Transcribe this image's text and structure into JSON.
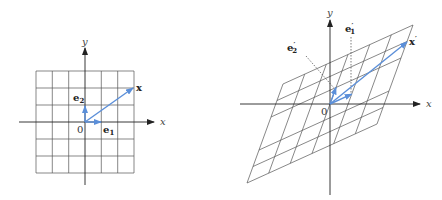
{
  "figure": {
    "left_panel": {
      "axis_labels": {
        "x": "x",
        "y": "y"
      },
      "origin_label": "0",
      "grid": {
        "columns": 6,
        "rows": 6
      },
      "vectors": [
        {
          "name": "e1",
          "label_base": "e",
          "label_sub": "1",
          "components": [
            1,
            0
          ]
        },
        {
          "name": "e2",
          "label_base": "e",
          "label_sub": "2",
          "components": [
            0,
            1
          ]
        },
        {
          "name": "x",
          "label_base": "x",
          "label_sub": "",
          "components": [
            3,
            2
          ]
        }
      ]
    },
    "right_panel": {
      "axis_labels": {
        "x": "x",
        "y": "y"
      },
      "origin_label": "0",
      "grid": {
        "columns": 6,
        "rows": 6,
        "transformed": true
      },
      "vectors": [
        {
          "name": "e1-prime",
          "label_base": "e",
          "label_sub": "1",
          "prime": "′"
        },
        {
          "name": "e2-prime",
          "label_base": "e",
          "label_sub": "2",
          "prime": "′"
        },
        {
          "name": "x-prime",
          "label_base": "x",
          "label_sub": "",
          "prime": "′"
        }
      ]
    },
    "colors": {
      "grid": "#555555",
      "axis": "#222222",
      "vector": "#5b8fd9",
      "leader_line": "#444444"
    }
  }
}
